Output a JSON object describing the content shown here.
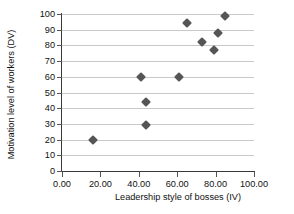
{
  "chart_data": {
    "type": "scatter",
    "title": "",
    "xlabel": "Leadership style of bosses (IV)",
    "ylabel": "Motivation level of workers  (DV)",
    "xlim": [
      0,
      100
    ],
    "ylim": [
      0,
      100
    ],
    "xticks": [
      0,
      20,
      40,
      60,
      80,
      100
    ],
    "yticks": [
      0,
      10,
      20,
      30,
      40,
      50,
      60,
      70,
      80,
      90,
      100
    ],
    "xtick_labels": [
      "0.00",
      "20.00",
      "40.00",
      "60.00",
      "80.00",
      "100.00"
    ],
    "ytick_labels": [
      "0",
      "10",
      "20",
      "30",
      "40",
      "50",
      "60",
      "70",
      "80",
      "90",
      "100"
    ],
    "grid": "horizontal",
    "legend": "none",
    "marker": "diamond",
    "marker_color": "#555558",
    "points": [
      {
        "x": 16,
        "y": 20
      },
      {
        "x": 41,
        "y": 60
      },
      {
        "x": 44,
        "y": 44
      },
      {
        "x": 44,
        "y": 29
      },
      {
        "x": 61,
        "y": 60
      },
      {
        "x": 65,
        "y": 94
      },
      {
        "x": 73,
        "y": 82
      },
      {
        "x": 79,
        "y": 77
      },
      {
        "x": 81,
        "y": 88
      },
      {
        "x": 85,
        "y": 99
      }
    ]
  },
  "colors": {
    "marker": "#555558",
    "gridline": "#c9c9c9",
    "axis": "#3a3a3a",
    "text": "#111111",
    "background": "#ffffff"
  }
}
